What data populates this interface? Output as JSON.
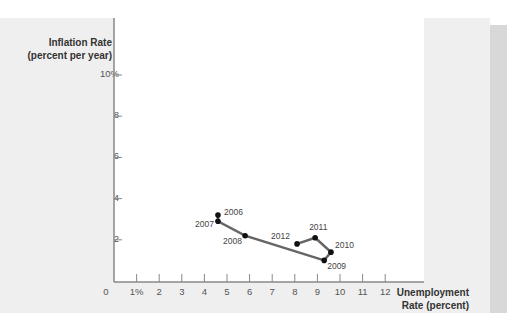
{
  "chart_data": {
    "type": "line",
    "title": "",
    "ylabel": "Inflation Rate (percent per year)",
    "xlabel": "Unemployment Rate (percent)",
    "ylabel_lines": [
      "Inflation Rate",
      "(percent per year)"
    ],
    "xlabel_lines": [
      "Unemployment",
      "Rate (percent)"
    ],
    "xlim": [
      0,
      12
    ],
    "ylim": [
      0,
      10
    ],
    "x_ticks": [
      "0",
      "1%",
      "2",
      "3",
      "4",
      "5",
      "6",
      "7",
      "8",
      "9",
      "10",
      "11",
      "12"
    ],
    "y_ticks": [
      "10%",
      "8",
      "6",
      "4",
      "2"
    ],
    "grid": false,
    "series": [
      {
        "name": "Unemployment vs Inflation",
        "color": "#666666",
        "points": [
          {
            "year": "2006",
            "x": 4.6,
            "y": 3.2
          },
          {
            "year": "2007",
            "x": 4.6,
            "y": 2.9
          },
          {
            "year": "2008",
            "x": 5.8,
            "y": 2.2
          },
          {
            "year": "2009",
            "x": 9.3,
            "y": 1.0
          },
          {
            "year": "2010",
            "x": 9.6,
            "y": 1.4
          },
          {
            "year": "2011",
            "x": 8.9,
            "y": 2.1
          },
          {
            "year": "2012",
            "x": 8.1,
            "y": 1.8
          }
        ]
      }
    ]
  }
}
